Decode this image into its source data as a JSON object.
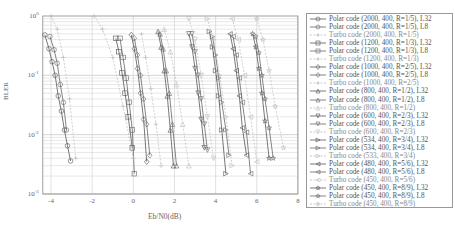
{
  "chart_data": {
    "type": "line",
    "title": "",
    "xlabel": "Eb/N0(dB)",
    "ylabel": "BLER",
    "xscale": "linear",
    "yscale": "log",
    "xlim": [
      -4.4,
      8
    ],
    "ylim": [
      0.001,
      1
    ],
    "xticks": [
      -4,
      -2,
      0,
      2,
      4,
      6,
      8
    ],
    "xtick_labels": [
      "-4",
      "-2",
      "0",
      "2",
      "4",
      "6",
      "8"
    ],
    "yticks": [
      0.001,
      0.01,
      0.1,
      1
    ],
    "ytick_labels": [
      "10^-3",
      "10^-2",
      "10^-1",
      "10^0"
    ],
    "grid": true,
    "legend_position": "right-outside",
    "series": [
      {
        "name": "Polar code (2000, 400, R=1/5), L32",
        "marker": "circle",
        "style": "solid",
        "color": "#555555",
        "x": [
          -4.3,
          -4.1,
          -3.95,
          -3.8,
          -3.65,
          -3.5,
          -3.35,
          -3.2,
          -3.05
        ],
        "y": [
          0.48,
          0.28,
          0.17,
          0.1,
          0.045,
          0.025,
          0.012,
          0.0065,
          0.0036
        ]
      },
      {
        "name": "Polar code (2000, 400, R=1/5), L8",
        "marker": "circle",
        "style": "solid",
        "color": "#666666",
        "x": [
          -4.05,
          -3.85,
          -3.7,
          -3.55,
          -3.4,
          -3.25
        ],
        "y": [
          0.45,
          0.27,
          0.16,
          0.07,
          0.035,
          0.012
        ]
      },
      {
        "name": "Turbo code (2000, 400, R=1/5)",
        "marker": "plus",
        "style": "dashed",
        "color": "#bbbbbb",
        "x": [
          -4.0,
          -3.7,
          -3.4,
          -3.1,
          -2.8
        ],
        "y": [
          1.0,
          0.6,
          0.2,
          0.04,
          0.004
        ]
      },
      {
        "name": "Polar code (1200, 400, R=1/3), L32",
        "marker": "square",
        "style": "solid",
        "color": "#555555",
        "x": [
          -0.85,
          -0.7,
          -0.55,
          -0.4,
          -0.25,
          -0.05
        ],
        "y": [
          0.42,
          0.25,
          0.11,
          0.05,
          0.02,
          0.006
        ]
      },
      {
        "name": "Polar code (1200, 400, R=1/3), L8",
        "marker": "square",
        "style": "solid",
        "color": "#666666",
        "x": [
          -0.65,
          -0.5,
          -0.35,
          -0.2,
          -0.05,
          0.05
        ],
        "y": [
          0.42,
          0.2,
          0.09,
          0.035,
          0.012,
          0.0022
        ]
      },
      {
        "name": "Turbo code (1200, 400, R=1/3)",
        "marker": "plus",
        "style": "dashed",
        "color": "#bbbbbb",
        "x": [
          -1.9,
          -1.5,
          -1.0,
          -0.5,
          0.0
        ],
        "y": [
          1.0,
          0.6,
          0.2,
          0.03,
          0.004
        ]
      },
      {
        "name": "Polar code (1000, 400, R=2/5), L32",
        "marker": "diamond",
        "style": "solid",
        "color": "#555555",
        "x": [
          -0.1,
          0.05,
          0.2,
          0.35,
          0.5,
          0.65
        ],
        "y": [
          0.48,
          0.28,
          0.13,
          0.05,
          0.018,
          0.0035
        ]
      },
      {
        "name": "Polar code (1000, 400, R=2/5), L8",
        "marker": "diamond",
        "style": "solid",
        "color": "#666666",
        "x": [
          0.05,
          0.2,
          0.35,
          0.5,
          0.65,
          0.8
        ],
        "y": [
          0.42,
          0.22,
          0.1,
          0.04,
          0.015,
          0.0045
        ]
      },
      {
        "name": "Turbo code (1000, 400, R=2/5)",
        "marker": "plus",
        "style": "dashed",
        "color": "#bbbbbb",
        "x": [
          0.4,
          0.6,
          0.85,
          1.1,
          1.35
        ],
        "y": [
          0.5,
          0.2,
          0.06,
          0.015,
          0.003
        ]
      },
      {
        "name": "Polar code (800, 400, R=1/2), L32",
        "marker": "triangle-up",
        "style": "solid",
        "color": "#555555",
        "x": [
          1.2,
          1.35,
          1.5,
          1.65,
          1.8,
          1.95
        ],
        "y": [
          0.55,
          0.3,
          0.12,
          0.045,
          0.012,
          0.003
        ]
      },
      {
        "name": "Polar code (800, 400, R=1/2), L8",
        "marker": "triangle-up",
        "style": "solid",
        "color": "#666666",
        "x": [
          1.3,
          1.45,
          1.6,
          1.75,
          1.9,
          2.1
        ],
        "y": [
          0.5,
          0.28,
          0.12,
          0.05,
          0.015,
          0.003
        ]
      },
      {
        "name": "Turbo code (800, 400, R=1/2)",
        "marker": "triangle-up",
        "style": "dashed",
        "color": "#bbbbbb",
        "x": [
          1.5,
          1.8,
          2.1,
          2.4,
          2.7
        ],
        "y": [
          0.6,
          0.25,
          0.07,
          0.015,
          0.003
        ]
      },
      {
        "name": "Polar code (600, 400, R=2/3), L32",
        "marker": "triangle-down",
        "style": "solid",
        "color": "#555555",
        "x": [
          2.7,
          2.85,
          3.0,
          3.15,
          3.3,
          3.45
        ],
        "y": [
          0.5,
          0.3,
          0.13,
          0.05,
          0.018,
          0.006
        ]
      },
      {
        "name": "Polar code (600, 400, R=2/3), L8",
        "marker": "triangle-down",
        "style": "solid",
        "color": "#666666",
        "x": [
          2.85,
          3.0,
          3.15,
          3.3,
          3.45,
          3.6
        ],
        "y": [
          0.5,
          0.25,
          0.1,
          0.04,
          0.015,
          0.0055
        ]
      },
      {
        "name": "Turbo code (600, 400, R=2/3)",
        "marker": "triangle-down",
        "style": "dashed",
        "color": "#bbbbbb",
        "x": [
          2.7,
          3.0,
          3.3,
          3.6,
          3.9
        ],
        "y": [
          0.9,
          0.4,
          0.1,
          0.02,
          0.004
        ]
      },
      {
        "name": "Polar code (534, 400, R=3/4), L32",
        "marker": "triangle-right",
        "style": "solid",
        "color": "#555555",
        "x": [
          3.7,
          3.85,
          4.0,
          4.15,
          4.3,
          4.5
        ],
        "y": [
          0.55,
          0.3,
          0.12,
          0.045,
          0.012,
          0.0022
        ]
      },
      {
        "name": "Polar code (534, 400, R=3/4), L8",
        "marker": "triangle-right",
        "style": "solid",
        "color": "#666666",
        "x": [
          3.85,
          4.0,
          4.15,
          4.3,
          4.5,
          4.65
        ],
        "y": [
          0.45,
          0.22,
          0.09,
          0.035,
          0.012,
          0.0045
        ]
      },
      {
        "name": "Turbo code (533, 400, R=3/4)",
        "marker": "triangle-right",
        "style": "dashed",
        "color": "#bbbbbb",
        "x": [
          3.6,
          3.9,
          4.2,
          4.5,
          4.8
        ],
        "y": [
          0.9,
          0.4,
          0.1,
          0.02,
          0.003
        ]
      },
      {
        "name": "Polar code (480, 400, R=5/6), L32",
        "marker": "triangle-left",
        "style": "solid",
        "color": "#555555",
        "x": [
          4.7,
          4.85,
          5.0,
          5.15,
          5.3,
          5.5
        ],
        "y": [
          0.5,
          0.28,
          0.12,
          0.045,
          0.013,
          0.0045
        ]
      },
      {
        "name": "Polar code (480, 400, R=5/6), L8",
        "marker": "triangle-left",
        "style": "solid",
        "color": "#666666",
        "x": [
          4.85,
          5.0,
          5.15,
          5.3,
          5.5,
          5.7
        ],
        "y": [
          0.45,
          0.22,
          0.09,
          0.035,
          0.011,
          0.0022
        ]
      },
      {
        "name": "Turbo code (450, 400, R=5/6)",
        "marker": "triangle-left",
        "style": "dashed",
        "color": "#bbbbbb",
        "x": [
          4.8,
          5.1,
          5.4,
          5.7,
          6.0
        ],
        "y": [
          0.9,
          0.4,
          0.1,
          0.02,
          0.0035
        ]
      },
      {
        "name": "Polar code (450, 400, R=8/9), L32",
        "marker": "star",
        "style": "solid",
        "color": "#555555",
        "x": [
          5.8,
          5.95,
          6.1,
          6.25,
          6.4,
          6.6
        ],
        "y": [
          0.5,
          0.3,
          0.13,
          0.05,
          0.017,
          0.004
        ]
      },
      {
        "name": "Polar code (450, 400, R=8/9), L8",
        "marker": "star",
        "style": "solid",
        "color": "#666666",
        "x": [
          5.95,
          6.1,
          6.25,
          6.4,
          6.6,
          6.8
        ],
        "y": [
          0.45,
          0.24,
          0.1,
          0.04,
          0.013,
          0.004
        ]
      },
      {
        "name": "Turbo code (450, 400, R=8/9)",
        "marker": "star",
        "style": "dashed",
        "color": "#bbbbbb",
        "x": [
          6.0,
          6.3,
          6.6,
          6.9,
          7.3
        ],
        "y": [
          0.9,
          0.4,
          0.12,
          0.03,
          0.006
        ]
      }
    ]
  },
  "axes": {
    "xlabel": "Eb/N0(dB)",
    "ylabel": "BLER"
  },
  "legend": {
    "entries": [
      "Polar code (2000, 400, R=1/5), L32",
      "Polar code (2000, 400, R=1/5), L8",
      "Turbo code (2000, 400, R=1/5)",
      "Polar code (1200, 400, R=1/3), L32",
      "Polar code (1200, 400, R=1/3), L8",
      "Turbo code (1200, 400, R=1/3)",
      "Polar code (1000, 400, R=2/5), L32",
      "Polar code (1000, 400, R=2/5), L8",
      "Turbo code (1000, 400, R=2/5)",
      "Polar code (800, 400, R=1/2), L32",
      "Polar code (800, 400, R=1/2), L8",
      "Turbo code (800, 400, R=1/2)",
      "Polar code (600, 400, R=2/3), L32",
      "Polar code (600, 400, R=2/3), L8",
      "Turbo code (600, 400, R=2/3)",
      "Polar code (534, 400, R=3/4), L32",
      "Polar code (534, 400, R=3/4), L8",
      "Turbo code (533, 400, R=3/4)",
      "Polar code (480, 400, R=5/6), L32",
      "Polar code (480, 400, R=5/6), L8",
      "Turbo code (450, 400, R=5/6)",
      "Polar code (450, 400, R=8/9), L32",
      "Polar code (450, 400, R=8/9), L8",
      "Turbo code (450, 400, R=8/9)"
    ]
  }
}
